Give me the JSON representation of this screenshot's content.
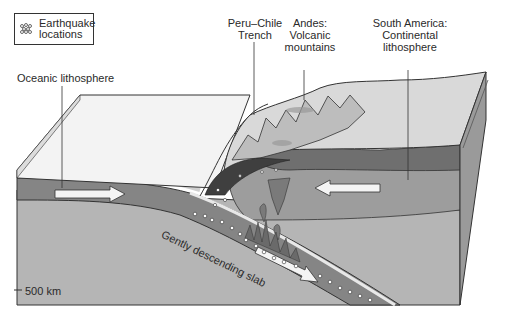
{
  "legend": {
    "icon": "earthquake-dots-icon",
    "label_line1": "Earthquake",
    "label_line2": "locations"
  },
  "labels": {
    "trench_line1": "Peru–Chile",
    "trench_line2": "Trench",
    "andes_line1": "Andes:",
    "andes_line2": "Volcanic",
    "andes_line3": "mountains",
    "sa_line1": "South America:",
    "sa_line2": "Continental",
    "sa_line3": "lithosphere",
    "oceanic": "Oceanic lithosphere",
    "slab": "Gently descending slab",
    "depth": "500 km"
  },
  "colors": {
    "ocean_surface": "#f2f2f2",
    "land_surface": "#d8d8d8",
    "lithosphere": "#8a8a8a",
    "asthenosphere": "#a8a8a8",
    "mantle_deep": "#b8b8b8",
    "dark_band": "#4a4a4a",
    "side_face": "#9a9a9a",
    "arrow_fill": "#f4f4f4"
  }
}
